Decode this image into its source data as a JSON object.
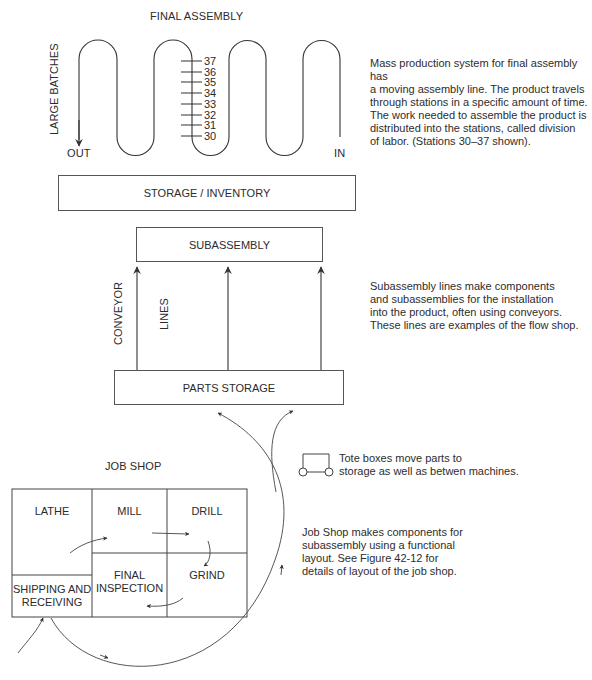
{
  "final_assembly": {
    "title": "FINAL ASSEMBLY",
    "side_label": "LARGE BATCHES",
    "out_label": "OUT",
    "in_label": "IN",
    "stations": [
      "37",
      "36",
      "35",
      "34",
      "33",
      "32",
      "31",
      "30"
    ],
    "description": "Mass production system for final assembly has\na moving assembly line. The product travels\nthrough stations in a specific amount of time.\nThe work needed to assemble the product is\ndistributed into the stations, called division\nof labor. (Stations 30–37 shown)."
  },
  "storage_inventory": {
    "label": "STORAGE / INVENTORY"
  },
  "subassembly": {
    "label": "SUBASSEMBLY",
    "conveyor_label": "CONVEYOR",
    "lines_label": "LINES",
    "description": "Subassembly lines make components\nand subassemblies for the installation\ninto the  product, often using conveyors.\nThese lines are examples of the flow shop."
  },
  "parts_storage": {
    "label": "PARTS STORAGE"
  },
  "tote_box": {
    "icon": "tote-box-icon",
    "description": "Tote boxes move parts to\nstorage as well as betwen machines."
  },
  "job_shop": {
    "title": "JOB SHOP",
    "cells": {
      "lathe": "LATHE",
      "mill": "MILL",
      "drill": "DRILL",
      "final_inspection": "FINAL\nINSPECTION",
      "grind": "GRIND",
      "shipping": "SHIPPING AND\nRECEIVING"
    },
    "description": "Job Shop makes components for\nsubassembly using a functional\nlayout. See Figure 42-12 for\ndetails of layout of the job shop."
  },
  "colors": {
    "line": "#444444",
    "text": "#2b2b2b",
    "background": "#ffffff"
  }
}
